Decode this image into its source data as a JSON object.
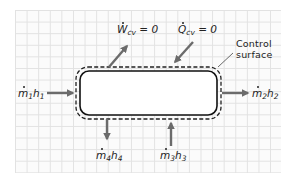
{
  "diagram": {
    "type": "control-volume",
    "colors": {
      "arrow": "#6b6b6b",
      "vessel_outline": "#111111",
      "control_surface": "#222222",
      "grid_line": "#e2e2e2",
      "text": "#222222"
    },
    "labels": {
      "work": {
        "symbol": "W",
        "subscript": "cv",
        "equals": "= 0"
      },
      "heat": {
        "symbol": "Q",
        "subscript": "cv",
        "equals": "= 0"
      },
      "control_surface": {
        "line1": "Control",
        "line2": "surface"
      },
      "inlet_1": {
        "m": "m",
        "m_sub": "1",
        "h": "h",
        "h_sub": "1"
      },
      "outlet_2": {
        "m": "m",
        "m_sub": "2",
        "h": "h",
        "h_sub": "2"
      },
      "inlet_3": {
        "m": "m",
        "m_sub": "3",
        "h": "h",
        "h_sub": "3"
      },
      "outlet_4": {
        "m": "m",
        "m_sub": "4",
        "h": "h",
        "h_sub": "4"
      }
    },
    "flows": [
      {
        "id": "1",
        "direction": "in",
        "side": "left"
      },
      {
        "id": "2",
        "direction": "out",
        "side": "right"
      },
      {
        "id": "3",
        "direction": "in",
        "side": "bottom"
      },
      {
        "id": "4",
        "direction": "out",
        "side": "bottom"
      },
      {
        "id": "W_cv",
        "direction": "out",
        "side": "top",
        "value": "0"
      },
      {
        "id": "Q_cv",
        "direction": "in",
        "side": "top",
        "value": "0"
      }
    ]
  }
}
